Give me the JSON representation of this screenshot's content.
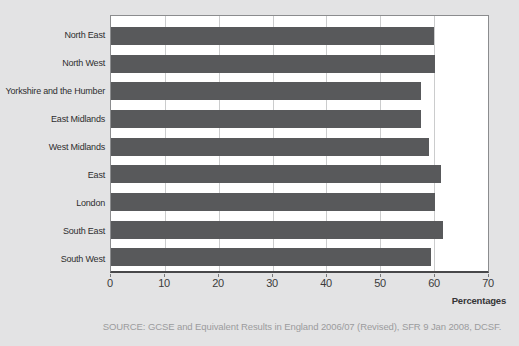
{
  "chart_data": {
    "type": "bar",
    "orientation": "horizontal",
    "categories": [
      "North East",
      "North West",
      "Yorkshire and the Humber",
      "East Midlands",
      "West Midlands",
      "East",
      "London",
      "South East",
      "South West"
    ],
    "values": [
      60.0,
      60.2,
      57.6,
      57.6,
      59.1,
      61.2,
      60.2,
      61.7,
      59.4
    ],
    "title": "",
    "xlabel": "Percentages",
    "ylabel": "",
    "xlim": [
      0,
      70
    ],
    "xticks": [
      0,
      10,
      20,
      30,
      40,
      50,
      60,
      70
    ],
    "grid": true,
    "legend": "none",
    "bar_color": "#58595b",
    "plot_bg": "#ffffff",
    "page_bg": "#e3e3e4",
    "gridline_color": "#cbcccd"
  },
  "source_note": "SOURCE: GCSE and Equivalent Results in England 2006/07 (Revised), SFR 9 Jan 2008, DCSF."
}
